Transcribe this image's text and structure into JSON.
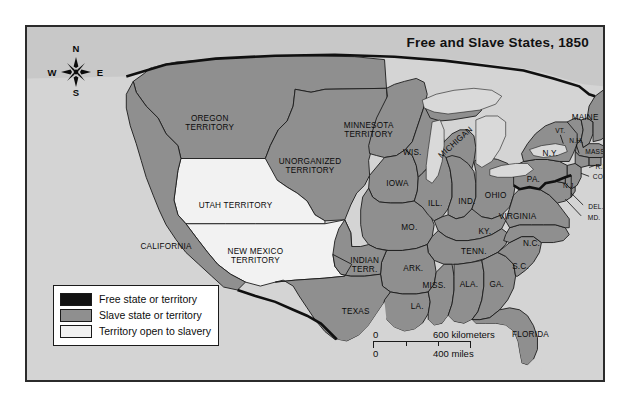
{
  "map": {
    "title": "Free and Slave States, 1850",
    "compass": {
      "n": "N",
      "e": "E",
      "s": "S",
      "w": "W",
      "name": "compass-rose"
    },
    "colors": {
      "free": "#121212",
      "slave": "#8f8f8f",
      "open": "#f2f2f2",
      "ocean": "#d4d4d4",
      "border": "#1a1a1a",
      "frame": "#2b2b2b"
    },
    "legend": {
      "items": [
        {
          "label": "Free state or territory",
          "swatch": "free"
        },
        {
          "label": "Slave state or territory",
          "swatch": "slave"
        },
        {
          "label": "Territory open to slavery",
          "swatch": "open"
        }
      ]
    },
    "scale": {
      "km_zero": "0",
      "km_value": "600 kilometers",
      "mi_zero": "0",
      "mi_value": "400 miles"
    },
    "labels": [
      {
        "text": "OREGON TERRITORY",
        "lines": [
          "OREGON",
          "TERRITORY"
        ],
        "x": 184,
        "y": 97,
        "size": "big"
      },
      {
        "text": "UNORGANIZED TERRITORY",
        "lines": [
          "UNORGANIZED",
          "TERRITORY"
        ],
        "x": 285,
        "y": 141,
        "size": "big"
      },
      {
        "text": "MINNESOTA TERRITORY",
        "lines": [
          "MINNESOTA",
          "TERRITORY"
        ],
        "x": 344,
        "y": 104,
        "size": "big"
      },
      {
        "text": "UTAH TERRITORY",
        "lines": [
          "UTAH TERRITORY"
        ],
        "x": 210,
        "y": 181,
        "size": "big"
      },
      {
        "text": "NEW MEXICO TERRITORY",
        "lines": [
          "NEW MEXICO",
          "TERRITORY"
        ],
        "x": 230,
        "y": 232,
        "size": "big"
      },
      {
        "text": "CALIFORNIA",
        "lines": [
          "CALIFORNIA"
        ],
        "x": 140,
        "y": 222,
        "size": "big"
      },
      {
        "text": "WIS.",
        "lines": [
          "WIS."
        ],
        "x": 388,
        "y": 127,
        "size": "big"
      },
      {
        "text": "MICHIGAN",
        "lines": [
          "MICHIGAN"
        ],
        "x": 432,
        "y": 117,
        "size": "big",
        "rot": true
      },
      {
        "text": "IOWA",
        "lines": [
          "IOWA"
        ],
        "x": 373,
        "y": 159,
        "size": "big"
      },
      {
        "text": "ILL.",
        "lines": [
          "ILL."
        ],
        "x": 411,
        "y": 179,
        "size": "big"
      },
      {
        "text": "IND.",
        "lines": [
          "IND."
        ],
        "x": 443,
        "y": 177,
        "size": "big"
      },
      {
        "text": "OHIO",
        "lines": [
          "OHIO"
        ],
        "x": 472,
        "y": 171,
        "size": "big"
      },
      {
        "text": "PA.",
        "lines": [
          "PA."
        ],
        "x": 510,
        "y": 155,
        "size": "big"
      },
      {
        "text": "N.Y.",
        "lines": [
          "N.Y."
        ],
        "x": 527,
        "y": 128,
        "size": "big"
      },
      {
        "text": "MAINE",
        "lines": [
          "MAINE"
        ],
        "x": 562,
        "y": 92,
        "size": "big"
      },
      {
        "text": "VT.",
        "lines": [
          "VT."
        ],
        "x": 537,
        "y": 105,
        "size": "sm"
      },
      {
        "text": "N.H.",
        "lines": [
          "N.H."
        ],
        "x": 553,
        "y": 115,
        "size": "sm"
      },
      {
        "text": "MASS.",
        "lines": [
          "MASS."
        ],
        "x": 573,
        "y": 126,
        "size": "sm"
      },
      {
        "text": "R.I.",
        "lines": [
          "R.I."
        ],
        "x": 578,
        "y": 142,
        "size": "sm"
      },
      {
        "text": "CONN.",
        "lines": [
          "CONN."
        ],
        "x": 581,
        "y": 152,
        "size": "sm"
      },
      {
        "text": "N.J.",
        "lines": [
          "N.J."
        ],
        "x": 546,
        "y": 161,
        "size": "sm"
      },
      {
        "text": "DEL.",
        "lines": [
          "DEL."
        ],
        "x": 573,
        "y": 182,
        "size": "sm"
      },
      {
        "text": "MD.",
        "lines": [
          "MD."
        ],
        "x": 571,
        "y": 193,
        "size": "sm"
      },
      {
        "text": "VIRGINIA",
        "lines": [
          "VIRGINIA"
        ],
        "x": 494,
        "y": 192,
        "size": "big"
      },
      {
        "text": "N.C.",
        "lines": [
          "N.C."
        ],
        "x": 508,
        "y": 219,
        "size": "big"
      },
      {
        "text": "S.C.",
        "lines": [
          "S.C."
        ],
        "x": 497,
        "y": 243,
        "size": "big"
      },
      {
        "text": "GA.",
        "lines": [
          "GA."
        ],
        "x": 473,
        "y": 261,
        "size": "big"
      },
      {
        "text": "FLORIDA",
        "lines": [
          "FLORIDA"
        ],
        "x": 507,
        "y": 311,
        "size": "big"
      },
      {
        "text": "ALA.",
        "lines": [
          "ALA."
        ],
        "x": 445,
        "y": 261,
        "size": "big"
      },
      {
        "text": "MISS.",
        "lines": [
          "MISS."
        ],
        "x": 410,
        "y": 262,
        "size": "big"
      },
      {
        "text": "TENN.",
        "lines": [
          "TENN."
        ],
        "x": 450,
        "y": 228,
        "size": "big"
      },
      {
        "text": "KY.",
        "lines": [
          "KY."
        ],
        "x": 461,
        "y": 207,
        "size": "big"
      },
      {
        "text": "MO.",
        "lines": [
          "MO."
        ],
        "x": 385,
        "y": 203,
        "size": "big"
      },
      {
        "text": "ARK.",
        "lines": [
          "ARK."
        ],
        "x": 389,
        "y": 245,
        "size": "big"
      },
      {
        "text": "LA.",
        "lines": [
          "LA."
        ],
        "x": 393,
        "y": 283,
        "size": "big"
      },
      {
        "text": "INDIAN TERR.",
        "lines": [
          "INDIAN",
          "TERR."
        ],
        "x": 340,
        "y": 241,
        "size": "big"
      },
      {
        "text": "TEXAS",
        "lines": [
          "TEXAS"
        ],
        "x": 331,
        "y": 288,
        "size": "big"
      }
    ]
  }
}
